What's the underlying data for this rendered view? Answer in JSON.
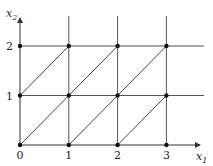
{
  "diagram": {
    "axes": {
      "x_label": "x",
      "x_sub": "1",
      "y_label": "x",
      "y_sub": "2",
      "x_ticks": [
        "0",
        "1",
        "2",
        "3"
      ],
      "y_ticks": [
        "1",
        "2"
      ]
    },
    "lattice_points": [
      [
        0,
        0
      ],
      [
        1,
        0
      ],
      [
        2,
        0
      ],
      [
        3,
        0
      ],
      [
        0,
        1
      ],
      [
        1,
        1
      ],
      [
        2,
        1
      ],
      [
        3,
        1
      ],
      [
        0,
        2
      ],
      [
        1,
        2
      ],
      [
        2,
        2
      ],
      [
        3,
        2
      ]
    ],
    "horizontal_lines": [
      0,
      1,
      2
    ],
    "vertical_lines": [
      0,
      1,
      2,
      3
    ],
    "diagonals": [
      [
        [
          0,
          0
        ],
        [
          2,
          2
        ]
      ],
      [
        [
          1,
          0
        ],
        [
          3,
          2
        ]
      ],
      [
        [
          2,
          0
        ],
        [
          3,
          1
        ]
      ],
      [
        [
          0,
          1
        ],
        [
          1,
          2
        ]
      ]
    ],
    "colors": {
      "line": "#555555",
      "point": "#111111"
    }
  }
}
